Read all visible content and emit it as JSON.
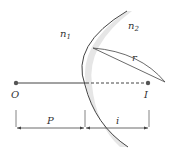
{
  "diagram": {
    "labels": {
      "n1": "n",
      "n1_sub": "1",
      "n2": "n",
      "n2_sub": "2",
      "r": "r",
      "O": "O",
      "I": "I",
      "P": "P",
      "i": "i"
    },
    "colors": {
      "line": "#444444",
      "shade": "#e6e6e6",
      "point": "#555555"
    }
  }
}
